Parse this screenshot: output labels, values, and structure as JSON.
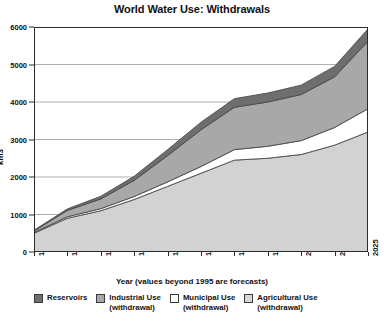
{
  "chart_data": {
    "type": "area",
    "stacked": true,
    "title": "World Water Use: Withdrawals",
    "xlabel": "Year (values beyond 1995 are forecasts)",
    "ylabel": "km3",
    "categories": [
      "1900",
      "1940",
      "1950",
      "1960",
      "1970",
      "1980",
      "1990",
      "1995",
      "2000",
      "2010",
      "2025"
    ],
    "ylim": [
      0,
      6000
    ],
    "yticks": [
      0,
      1000,
      2000,
      3000,
      4000,
      5000,
      6000
    ],
    "grid": true,
    "legend_position": "bottom",
    "series": [
      {
        "name": "Agricultural Use (withdrawal)",
        "key": "agricultural",
        "color": "#d2d2d2",
        "values": [
          500,
          900,
          1100,
          1400,
          1750,
          2100,
          2450,
          2500,
          2600,
          2850,
          3200
        ]
      },
      {
        "name": "Municipal Use (withdrawal)",
        "key": "municipal",
        "color": "#ffffff",
        "values": [
          20,
          40,
          55,
          80,
          120,
          180,
          280,
          320,
          370,
          470,
          620
        ]
      },
      {
        "name": "Industrial Use (withdrawal)",
        "key": "industrial",
        "color": "#a8a8a8",
        "values": [
          40,
          170,
          260,
          430,
          700,
          980,
          1130,
          1180,
          1230,
          1350,
          1800
        ]
      },
      {
        "name": "Reservoirs",
        "key": "reservoirs",
        "color": "#6e6e6e",
        "values": [
          20,
          40,
          70,
          110,
          160,
          200,
          230,
          240,
          250,
          280,
          330
        ]
      }
    ],
    "totals": [
      580,
      1150,
      1485,
      2020,
      2730,
      3460,
      4090,
      4240,
      4450,
      4950,
      5950
    ]
  },
  "legend": {
    "items": [
      {
        "label": "Reservoirs",
        "sub": "",
        "swatch": "#6e6e6e",
        "name": "reservoirs"
      },
      {
        "label": "Industrial Use",
        "sub": "(withdrawal)",
        "swatch": "#a8a8a8",
        "name": "industrial-use"
      },
      {
        "label": "Municipal Use",
        "sub": "(withdrawal)",
        "swatch": "#ffffff",
        "name": "municipal-use"
      },
      {
        "label": "Agricultural Use",
        "sub": "(withdrawal)",
        "swatch": "#d8d8d8",
        "name": "agricultural-use"
      }
    ]
  },
  "axes": {
    "y_title": "km3",
    "x_title": "Year (values beyond 1995 are forecasts)"
  },
  "colors": {
    "axis": "#2b2b2b",
    "grid": "#9a9a9a",
    "outline": "#4a4a4a",
    "background": "#ffffff"
  }
}
